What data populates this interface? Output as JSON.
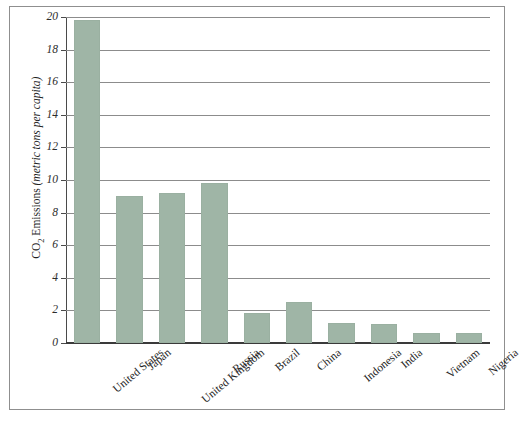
{
  "chart_data": {
    "type": "bar",
    "title": "",
    "subtitle": "",
    "xlabel": "",
    "ylabel": "CO2 Emissions (metric tons per capita)",
    "ylabel_prefix": "CO",
    "ylabel_subscript": "2",
    "ylabel_suffix": " Emissions ",
    "ylabel_unit": "(metric tons per capita)",
    "ylim": [
      0,
      20
    ],
    "ytick_labels": [
      "0",
      "2",
      "4",
      "6",
      "8",
      "10",
      "12",
      "14",
      "16",
      "18",
      "20"
    ],
    "ytick_values": [
      0,
      2,
      4,
      6,
      8,
      10,
      12,
      14,
      16,
      18,
      20
    ],
    "grid": true,
    "grid_axis": "y",
    "legend": false,
    "legend_position": "none",
    "bar_color": "#9fb5a6",
    "grid_color": "#8c8c8c",
    "axis_color": "#3a3a3a",
    "categories": [
      "United States",
      "Japan",
      "United Kingdom",
      "Russia",
      "Brazil",
      "China",
      "Indonesia",
      "India",
      "Vietnam",
      "Nigeria"
    ],
    "values": [
      19.8,
      9.0,
      9.2,
      9.8,
      1.85,
      2.5,
      1.2,
      1.15,
      0.6,
      0.6
    ]
  }
}
